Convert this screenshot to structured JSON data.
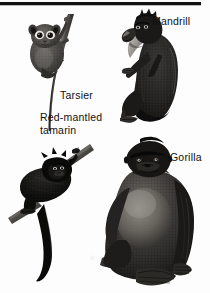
{
  "page": {
    "background_color": "#fdfdfd",
    "ink_color": "#111111",
    "has_top_rule": true
  },
  "labels": [
    {
      "name": "mandrill",
      "text": "Mandrill"
    },
    {
      "name": "tarsier",
      "text": "Tarsier"
    },
    {
      "name": "red-mantled-line1",
      "text": "Red-mantled"
    },
    {
      "name": "red-mantled-line2",
      "text": "tamarin"
    },
    {
      "name": "gorilla",
      "text": "Gorilla"
    }
  ],
  "figures": [
    {
      "name": "tarsier-figure",
      "label": "Tarsier",
      "position": "top-left",
      "pose": "clinging to vertical branch, long tail"
    },
    {
      "name": "mandrill-figure",
      "label": "Mandrill",
      "position": "top-right",
      "pose": "sitting upright facing left"
    },
    {
      "name": "red-mantled-tamarin-figure",
      "label": "Red-mantled tamarin",
      "position": "bottom-left",
      "pose": "on diagonal branch, long tail"
    },
    {
      "name": "gorilla-figure",
      "label": "Gorilla",
      "position": "bottom-right",
      "pose": "seated, facing forward"
    }
  ]
}
